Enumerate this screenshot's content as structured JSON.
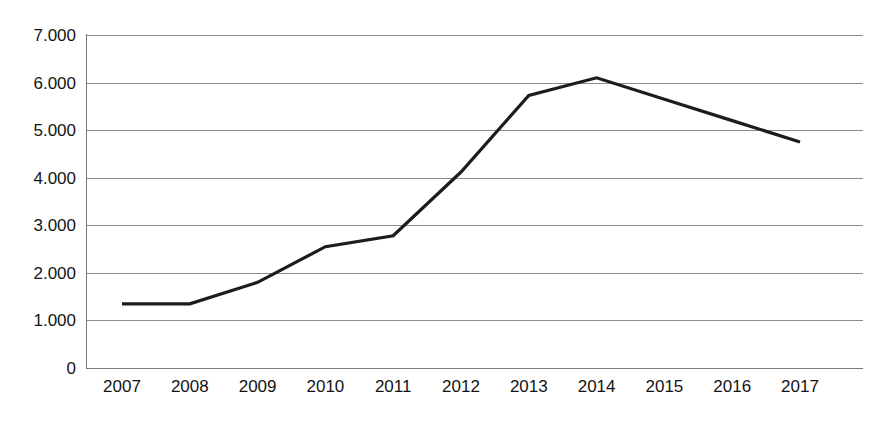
{
  "chart_data": {
    "type": "line",
    "title": "",
    "subtitle": "",
    "xlabel": "",
    "ylabel": "",
    "categories": [
      "2007",
      "2008",
      "2009",
      "2010",
      "2011",
      "2012",
      "2013",
      "2014",
      "2015",
      "2016",
      "2017"
    ],
    "x": [
      2007,
      2008,
      2009,
      2010,
      2011,
      2012,
      2013,
      2014,
      2015,
      2016,
      2017
    ],
    "values": [
      1350,
      1350,
      1800,
      2550,
      2780,
      4120,
      5730,
      6100,
      5650,
      5200,
      4750
    ],
    "series": [
      {
        "name": "",
        "color": "#1c1c1c",
        "values": [
          1350,
          1350,
          1800,
          2550,
          2780,
          4120,
          5730,
          6100,
          5650,
          5200,
          4750
        ]
      }
    ],
    "ylim": [
      0,
      7000
    ],
    "ytick_values": [
      0,
      1000,
      2000,
      3000,
      4000,
      5000,
      6000,
      7000
    ],
    "ytick_labels": [
      "0",
      "1.000",
      "2.000",
      "3.000",
      "4.000",
      "5.000",
      "6.000",
      "7.000"
    ],
    "xtick_labels": [
      "2007",
      "2008",
      "2009",
      "2010",
      "2011",
      "2012",
      "2013",
      "2014",
      "2015",
      "2016",
      "2017"
    ],
    "grid": true,
    "grid_axis": "y",
    "legend": false,
    "legend_position": "none",
    "markers": false,
    "annotations": [],
    "colors": {
      "line": "#1c1c1c",
      "grid": "#8c8c8c",
      "axis": "#7a7a7a",
      "text": "#141414",
      "background": "#ffffff"
    }
  }
}
